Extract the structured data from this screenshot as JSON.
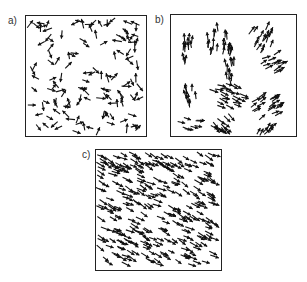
{
  "figure": {
    "panels": [
      {
        "id": "a",
        "label": "a)",
        "description": "disordered, randomly oriented arrows",
        "box": [
          25,
          15,
          122,
          122
        ],
        "mode": "random",
        "count": 130,
        "seed": 3
      },
      {
        "id": "b",
        "label": "b)",
        "description": "clustered groups of locally aligned arrows",
        "box": [
          170,
          14,
          127,
          123
        ],
        "mode": "clusters",
        "seed": 11,
        "clusters": [
          {
            "cx": 18,
            "cy": 35,
            "n": 12,
            "angle": -90,
            "rx": 6,
            "ry": 16
          },
          {
            "cx": 50,
            "cy": 28,
            "n": 22,
            "angle": -85,
            "rx": 14,
            "ry": 16
          },
          {
            "cx": 60,
            "cy": 55,
            "n": 10,
            "angle": -95,
            "rx": 6,
            "ry": 12
          },
          {
            "cx": 92,
            "cy": 22,
            "n": 16,
            "angle": -60,
            "rx": 12,
            "ry": 14
          },
          {
            "cx": 105,
            "cy": 48,
            "n": 14,
            "angle": -30,
            "rx": 14,
            "ry": 10
          },
          {
            "cx": 20,
            "cy": 80,
            "n": 10,
            "angle": -95,
            "rx": 6,
            "ry": 10
          },
          {
            "cx": 58,
            "cy": 82,
            "n": 24,
            "angle": 20,
            "rx": 18,
            "ry": 12
          },
          {
            "cx": 98,
            "cy": 92,
            "n": 22,
            "angle": -30,
            "rx": 16,
            "ry": 12
          },
          {
            "cx": 22,
            "cy": 110,
            "n": 8,
            "angle": 15,
            "rx": 12,
            "ry": 6
          },
          {
            "cx": 55,
            "cy": 110,
            "n": 14,
            "angle": 40,
            "rx": 12,
            "ry": 8
          },
          {
            "cx": 95,
            "cy": 115,
            "n": 8,
            "angle": -50,
            "rx": 10,
            "ry": 6
          }
        ]
      },
      {
        "id": "c",
        "label": "c)",
        "description": "dense, globally aligned arrows pointing lower-right",
        "box": [
          95,
          149,
          127,
          122
        ],
        "mode": "aligned",
        "count": 300,
        "angle": 28,
        "seed": 7
      }
    ]
  }
}
